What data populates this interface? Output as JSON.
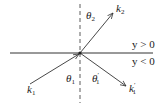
{
  "diagram": {
    "title": "",
    "regions": {
      "upper": "y > 0",
      "lower": "y < 0"
    },
    "vectors": {
      "incident": {
        "symbol": "k",
        "subscript": "1",
        "prime": ""
      },
      "transmitted": {
        "symbol": "k",
        "subscript": "2",
        "prime": ""
      },
      "reflected": {
        "symbol": "k",
        "subscript": "1",
        "prime": "′"
      }
    },
    "angles": {
      "incident": {
        "symbol": "θ",
        "subscript": "1",
        "prime": ""
      },
      "transmitted": {
        "symbol": "θ",
        "subscript": "2",
        "prime": ""
      },
      "reflected": {
        "symbol": "θ",
        "subscript": "1",
        "prime": "′"
      }
    },
    "colors": {
      "line": "#333333",
      "background": "#ffffff"
    }
  }
}
